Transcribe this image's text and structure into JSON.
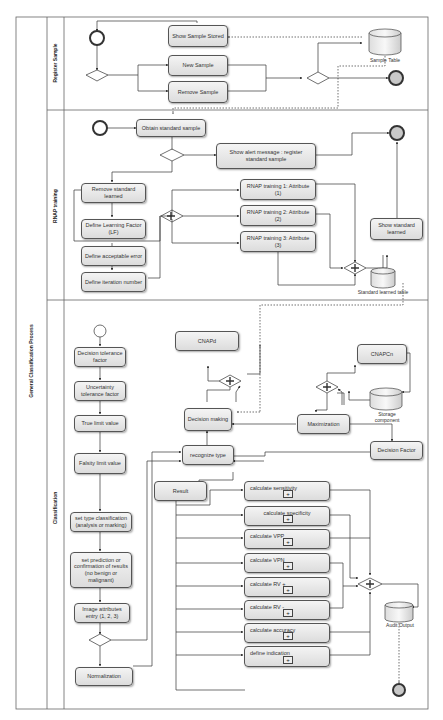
{
  "pool": {
    "label": "General Classification Process"
  },
  "lanes": [
    {
      "id": "register",
      "label": "Register Sample"
    },
    {
      "id": "rnap",
      "label": "RNAP training"
    },
    {
      "id": "classification",
      "label": "Classification"
    }
  ],
  "register_lane": {
    "tasks": {
      "show_sample_stored": "Show Sample Stored",
      "new_sample": "New Sample",
      "remove_sample": "Remove Sample"
    },
    "data_store": "Sample Table"
  },
  "rnap_lane": {
    "tasks": {
      "obtain_standard_sample": "Obtain standard sample",
      "show_alert": "Show alert message : register standard sample",
      "remove_standard_learned": "Remove standard learned",
      "define_learning_factor": "Define Learning Factor (LF)",
      "define_acceptable_error": "Define acceptable error",
      "define_iteration_number": "Define iteration number",
      "rnap_training_1": "RNAP training 1: Attribute (1)",
      "rnap_training_2": "RNAP training 2: Attribute (2)",
      "rnap_training_3": "RNAP training 3: Attribute (3)",
      "show_standard_learned": "Show standard learned"
    },
    "data_store": "Standard learned table"
  },
  "classification_lane": {
    "tasks": {
      "decision_tolerance": "Decision tolerance factor",
      "uncertainty_tolerance": "Uncertainty tolerance factor",
      "true_limit": "True limit value",
      "falsity_limit": "Falsity limit value",
      "set_type_classification": "set type classification (analysis or marking)",
      "set_prediction": "set prediction or confirmation of results (no benign or malignant)",
      "image_attributes": "Image attributes entry (1, 2, 3)",
      "normalization": "Normalization",
      "cnapd": "CNAPd",
      "decision_making": "Decision making",
      "recognize_type": "recognize type",
      "result": "Result",
      "cnapcn": "CNAPCn",
      "maximization": "Maximization",
      "decision_factor": "Decision Factor"
    },
    "subprocesses": [
      "calculate sensitivity",
      "calculate specificity",
      "calculate VPP",
      "calculate VPN",
      "calculate RV +",
      "calculate RV -",
      "calculate accuracy",
      "define indication"
    ],
    "data_stores": {
      "storage": "Storage component",
      "audit": "Audit Output"
    }
  },
  "colors": {
    "line": "#444444",
    "task_fill": "#e8e8e8",
    "end_event": "#c8c8c8"
  }
}
